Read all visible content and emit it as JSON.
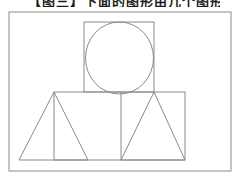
{
  "page": {
    "background_color": "#ffffff",
    "width": 242,
    "height": 183
  },
  "caption": {
    "clipped_text": "【图三】下面的图形由几个图形组成",
    "note": "caption cut off at top edge of screenshot; only bottom strokes of glyphs visible",
    "text_color": "#1c1c1c"
  },
  "diagram": {
    "stroke_color": "#8a8a8a",
    "fill": "none",
    "shapes": [
      {
        "tag": "rect",
        "name": "outer-border-rect",
        "attrs": {
          "x": 9,
          "y": 12,
          "width": 222,
          "height": 159
        }
      },
      {
        "tag": "rect",
        "name": "top-square",
        "attrs": {
          "x": 84,
          "y": 22,
          "width": 70,
          "height": 70
        }
      },
      {
        "tag": "ellipse",
        "name": "inscribed-circle",
        "attrs": {
          "cx": 119.5,
          "cy": 58,
          "rx": 34,
          "ry": 36
        }
      },
      {
        "tag": "rect",
        "name": "base-rectangle",
        "attrs": {
          "x": 54,
          "y": 92,
          "width": 131,
          "height": 68
        }
      },
      {
        "tag": "line",
        "name": "base-rect-middle-divider",
        "attrs": {
          "x1": 121,
          "y1": 92,
          "x2": 121,
          "y2": 160
        }
      },
      {
        "tag": "polygon",
        "name": "left-triangle",
        "attrs": {
          "points": "19,160 54,92 88,160"
        }
      },
      {
        "tag": "polygon",
        "name": "right-triangle",
        "attrs": {
          "points": "121,160 154,92 185,160"
        }
      }
    ]
  }
}
